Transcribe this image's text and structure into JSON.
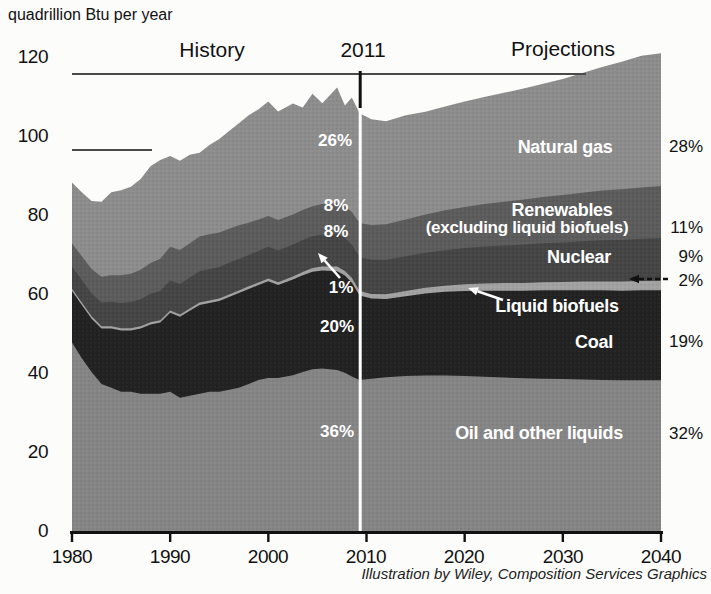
{
  "title": "quadrillion Btu per year",
  "period_labels": {
    "history": "History",
    "divider_year": "2011",
    "projections": "Projections"
  },
  "y_axis": {
    "ticks": [
      "120",
      "100",
      "80",
      "60",
      "40",
      "20",
      "0"
    ]
  },
  "x_axis": {
    "ticks": [
      "1980",
      "1990",
      "2000",
      "2010",
      "2020",
      "2030",
      "2040"
    ]
  },
  "history_shares": {
    "natural_gas": "26%",
    "renewables": "8%",
    "nuclear": "8%",
    "liquid_biofuels": "1%",
    "coal": "20%",
    "oil": "36%"
  },
  "projection_shares": {
    "natural_gas": "28%",
    "renewables": "11%",
    "nuclear": "9%",
    "liquid_biofuels": "2%",
    "coal": "19%",
    "oil": "32%"
  },
  "series_labels": {
    "natural_gas": "Natural gas",
    "renewables_line1": "Renewables",
    "renewables_line2": "(excluding liquid biofuels)",
    "nuclear": "Nuclear",
    "liquid_biofuels": "Liquid biofuels",
    "coal": "Coal",
    "oil": "Oil and other liquids"
  },
  "caption": "Illustration by Wiley, Composition Services Graphics",
  "colors": {
    "oil": "#858585",
    "coal": "#222222",
    "biofuels": "#a2a2a2",
    "nuclear": "#454545",
    "renewables": "#5c5c5c",
    "gas": "#8d8d8d",
    "axis": "#111111",
    "ref_line": "#4a4a4a",
    "divider": "#ffffff"
  },
  "chart_data": {
    "type": "area",
    "stacked": true,
    "title": "quadrillion Btu per year",
    "ylabel": "quadrillion Btu per year",
    "xlim": [
      1980,
      2040
    ],
    "ylim": [
      0,
      120
    ],
    "grid": false,
    "divider_label": "2011",
    "x": [
      1980,
      1981,
      1982,
      1983,
      1984,
      1985,
      1986,
      1987,
      1988,
      1989,
      1990,
      1991,
      1992,
      1993,
      1994,
      1995,
      1996,
      1997,
      1998,
      1999,
      2000,
      2001,
      2002.5,
      2003.5,
      2004.5,
      2005.5,
      2007,
      2007.8,
      2008.5,
      2009.3,
      2010.5,
      2012,
      2014,
      2016,
      2018,
      2020,
      2022,
      2024,
      2026,
      2028,
      2030,
      2032,
      2034,
      2036,
      2038,
      2040
    ],
    "series": [
      {
        "name": "Oil and other liquids",
        "color_key": "oil",
        "values": [
          48,
          44,
          40.5,
          37.5,
          36.5,
          35.5,
          35.5,
          35,
          35,
          35,
          35.5,
          34,
          34.5,
          35,
          35.5,
          35.5,
          36,
          36.5,
          37.5,
          38.5,
          39,
          39,
          39.7,
          40.5,
          41.2,
          41.4,
          41,
          40.3,
          39.4,
          38.5,
          38.8,
          39.2,
          39.5,
          39.6,
          39.6,
          39.5,
          39.3,
          39.1,
          38.9,
          38.8,
          38.7,
          38.6,
          38.5,
          38.4,
          38.4,
          38.4
        ]
      },
      {
        "name": "Coal",
        "color_key": "coal",
        "values": [
          13,
          13.5,
          13.5,
          14,
          15,
          15.5,
          15.5,
          16.5,
          17.5,
          18,
          20,
          20.5,
          21.5,
          22.5,
          22.5,
          23,
          23.5,
          24,
          24,
          24,
          24.5,
          23.5,
          24.2,
          24.5,
          24.7,
          24.8,
          25,
          24.6,
          23.8,
          21.4,
          20.3,
          19.8,
          20.2,
          20.8,
          21.2,
          21.5,
          21.8,
          22,
          22.2,
          22.4,
          22.5,
          22.6,
          22.7,
          22.7,
          22.8,
          22.8
        ]
      },
      {
        "name": "Liquid biofuels",
        "color_key": "biofuels",
        "values": [
          0.6,
          0.6,
          0.6,
          0.6,
          0.6,
          0.6,
          0.6,
          0.6,
          0.6,
          0.6,
          0.6,
          0.6,
          0.6,
          0.6,
          0.6,
          0.6,
          0.65,
          0.65,
          0.7,
          0.7,
          0.7,
          0.75,
          0.8,
          0.85,
          0.95,
          1.05,
          1.2,
          1.2,
          1.15,
          1.1,
          1.15,
          1.2,
          1.35,
          1.45,
          1.55,
          1.7,
          1.8,
          1.9,
          1.95,
          2.05,
          2.1,
          2.2,
          2.25,
          2.3,
          2.35,
          2.4
        ]
      },
      {
        "name": "Nuclear",
        "color_key": "nuclear",
        "values": [
          5.6,
          5.7,
          5.8,
          6,
          6.2,
          6.4,
          6.6,
          6.8,
          7.2,
          7.4,
          7.6,
          7.7,
          7.8,
          7.9,
          8,
          8,
          8,
          8,
          7.9,
          7.95,
          8,
          8,
          8.1,
          8.05,
          8,
          8.1,
          8.3,
          8.35,
          8.45,
          8.6,
          8.65,
          8.7,
          8.75,
          8.85,
          9,
          9.2,
          9.35,
          9.5,
          9.7,
          9.85,
          10,
          10.2,
          10.4,
          10.55,
          10.7,
          10.8
        ]
      },
      {
        "name": "Renewables (excluding liquid biofuels)",
        "color_key": "renewables",
        "values": [
          5.8,
          6,
          6.2,
          6.5,
          6.7,
          7,
          7.2,
          7.5,
          7.8,
          8.2,
          8.5,
          8.6,
          8.7,
          8.8,
          8.8,
          8.7,
          8.6,
          8.5,
          8.2,
          8,
          7.8,
          7.7,
          7.6,
          7.6,
          7.6,
          7.7,
          7.9,
          8,
          8.2,
          8.6,
          8.8,
          9,
          9.3,
          9.7,
          10.1,
          10.4,
          10.8,
          11.1,
          11.4,
          11.7,
          12,
          12.3,
          12.6,
          12.8,
          13,
          13.2
        ]
      },
      {
        "name": "Natural gas",
        "color_key": "gas",
        "values": [
          15.5,
          16.2,
          17.2,
          19,
          21,
          21.5,
          22,
          23,
          24.5,
          25,
          23,
          22.6,
          22.4,
          21.2,
          22.6,
          23.7,
          24.75,
          25.85,
          27.2,
          27.85,
          29,
          27.5,
          28.1,
          26,
          28.5,
          25.5,
          29.1,
          25.5,
          29,
          27.8,
          26.8,
          26.1,
          26.4,
          26,
          26.3,
          26.7,
          27.1,
          27.6,
          28.1,
          28.7,
          29.4,
          30.3,
          31.3,
          32.3,
          33.3,
          33.6
        ]
      }
    ]
  }
}
